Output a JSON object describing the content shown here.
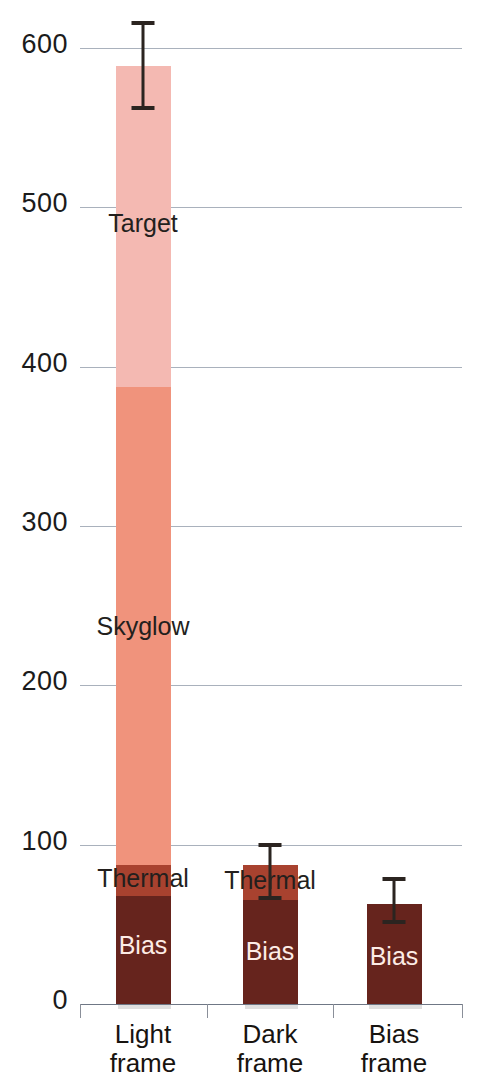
{
  "chart_data": {
    "type": "bar",
    "title": "",
    "subtitle": "",
    "xlabel": "",
    "ylabel": "",
    "stacked": true,
    "grid": true,
    "legend_position": "none",
    "ylim": [
      0,
      620
    ],
    "yticks": [
      0,
      100,
      200,
      300,
      400,
      500,
      600
    ],
    "ytick_labels": [
      "0",
      "100",
      "200",
      "300",
      "400",
      "500",
      "600"
    ],
    "categories": [
      "Light frame",
      "Dark frame",
      "Bias frame"
    ],
    "category_label_lines": [
      [
        "Light",
        "frame"
      ],
      [
        "Dark",
        "frame"
      ],
      [
        "Bias",
        "frame"
      ]
    ],
    "series": [
      {
        "name": "Bias",
        "color": "#66241d",
        "values": [
          68,
          65,
          63
        ]
      },
      {
        "name": "Thermal",
        "color": "#a8422f",
        "values": [
          19,
          22,
          0
        ]
      },
      {
        "name": "Skyglow",
        "color": "#f0937c",
        "values": [
          300,
          0,
          0
        ]
      },
      {
        "name": "Target",
        "color": "#f4b9b2",
        "values": [
          202,
          0,
          0
        ]
      }
    ],
    "totals": [
      589,
      87,
      63
    ],
    "error_bars": [
      {
        "category": "Light frame",
        "value": 589,
        "upper": 617,
        "lower": 561
      },
      {
        "category": "Dark frame",
        "value": 87,
        "upper": 101,
        "lower": 65
      },
      {
        "category": "Bias frame",
        "value": 63,
        "upper": 80,
        "lower": 50
      }
    ],
    "segment_labels": [
      {
        "text": "Target",
        "category": "Light frame",
        "at": 490,
        "style": "dark"
      },
      {
        "text": "Skyglow",
        "category": "Light frame",
        "at": 237,
        "style": "dark"
      },
      {
        "text": "Thermal",
        "category": "Light frame",
        "at": 79,
        "style": "dark"
      },
      {
        "text": "Bias",
        "category": "Light frame",
        "at": 37,
        "style": "light"
      },
      {
        "text": "Thermal",
        "category": "Dark frame",
        "at": 78,
        "style": "dark"
      },
      {
        "text": "Bias",
        "category": "Dark frame",
        "at": 33,
        "style": "light"
      },
      {
        "text": "Bias",
        "category": "Bias frame",
        "at": 30,
        "style": "light"
      }
    ],
    "colors": {
      "bias": "#66241d",
      "thermal": "#a8422f",
      "skyglow": "#f0937c",
      "target": "#f4b9b2",
      "gridline": "#9aa3b0",
      "axis": "#6f7785",
      "error_bar": "#2b2420",
      "background": "#ffffff"
    }
  }
}
